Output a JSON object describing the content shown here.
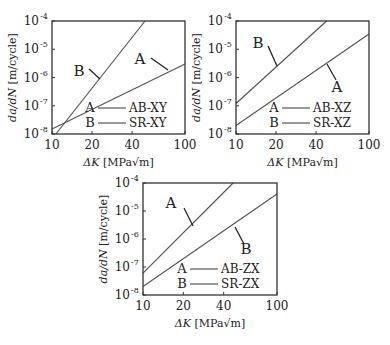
{
  "chart_data": [
    {
      "type": "line",
      "scale": {
        "x": "log",
        "y": "log"
      },
      "title": "",
      "xlabel": "ΔK [MPa√m]",
      "ylabel": "da/dN [m/cycle]",
      "xlim": [
        10,
        100
      ],
      "ylim": [
        1e-08,
        0.0001
      ],
      "xticks": [
        "10",
        "20",
        "40",
        "100"
      ],
      "yticks": [
        "10^-8",
        "10^-7",
        "10^-6",
        "10^-5",
        "10^-4"
      ],
      "legend": [
        {
          "letter": "A",
          "name": "AB-XY"
        },
        {
          "letter": "B",
          "name": "SR-XY"
        }
      ],
      "series": [
        {
          "name": "AB-XY",
          "label": "A",
          "points": [
            [
              10,
              1.5e-08
            ],
            [
              100,
              3e-06
            ]
          ]
        },
        {
          "name": "SR-XY",
          "label": "B",
          "points": [
            [
              10.7,
              1e-08
            ],
            [
              50,
              0.0001
            ]
          ]
        }
      ],
      "box": {
        "x": 52,
        "y": 21,
        "w": 133,
        "h": 113
      },
      "annotations": [
        {
          "text": "B",
          "x": 79,
          "y": 76,
          "lx1": 89,
          "ly1": 69,
          "lx2": 100,
          "ly2": 79
        },
        {
          "text": "A",
          "x": 140,
          "y": 64,
          "lx1": 151,
          "ly1": 58,
          "lx2": 168,
          "ly2": 70
        }
      ]
    },
    {
      "type": "line",
      "scale": {
        "x": "log",
        "y": "log"
      },
      "title": "",
      "xlabel": "ΔK [MPa√m]",
      "ylabel": "da/dN [m/cycle]",
      "xlim": [
        10,
        100
      ],
      "ylim": [
        1e-08,
        0.0001
      ],
      "xticks": [
        "10",
        "20",
        "40",
        "100"
      ],
      "yticks": [
        "10^-8",
        "10^-7",
        "10^-6",
        "10^-5",
        "10^-4"
      ],
      "legend": [
        {
          "letter": "A",
          "name": "AB-XZ"
        },
        {
          "letter": "B",
          "name": "SR-XZ"
        }
      ],
      "series": [
        {
          "name": "AB-XZ",
          "label": "A",
          "points": [
            [
              10,
              2e-08
            ],
            [
              100,
              3.5e-05
            ]
          ]
        },
        {
          "name": "SR-XZ",
          "label": "B",
          "points": [
            [
              10,
              1.2e-07
            ],
            [
              48,
              0.0001
            ]
          ]
        }
      ],
      "box": {
        "x": 236,
        "y": 21,
        "w": 133,
        "h": 113
      },
      "annotations": [
        {
          "text": "B",
          "x": 258,
          "y": 48,
          "lx1": 268,
          "ly1": 46,
          "lx2": 277,
          "ly2": 66
        },
        {
          "text": "A",
          "x": 337,
          "y": 92,
          "lx1": 327,
          "ly1": 64,
          "lx2": 336,
          "ly2": 80
        }
      ]
    },
    {
      "type": "line",
      "scale": {
        "x": "log",
        "y": "log"
      },
      "title": "",
      "xlabel": "ΔK [MPa√m]",
      "ylabel": "da/dN [m/cycle]",
      "xlim": [
        10,
        100
      ],
      "ylim": [
        1e-08,
        0.0001
      ],
      "xticks": [
        "10",
        "20",
        "40",
        "100"
      ],
      "yticks": [
        "10^-8",
        "10^-7",
        "10^-6",
        "10^-5",
        "10^-4"
      ],
      "legend": [
        {
          "letter": "A",
          "name": "AB-ZX"
        },
        {
          "letter": "B",
          "name": "SR-ZX"
        }
      ],
      "series": [
        {
          "name": "AB-ZX",
          "label": "A",
          "points": [
            [
              10,
              6e-08
            ],
            [
              47,
              0.0001
            ]
          ]
        },
        {
          "name": "SR-ZX",
          "label": "B",
          "points": [
            [
              10,
              2e-08
            ],
            [
              100,
              4e-05
            ]
          ]
        }
      ],
      "box": {
        "x": 143,
        "y": 183,
        "w": 134,
        "h": 112
      },
      "annotations": [
        {
          "text": "A",
          "x": 171,
          "y": 208,
          "lx1": 184,
          "ly1": 208,
          "lx2": 193,
          "ly2": 226
        },
        {
          "text": "B",
          "x": 246,
          "y": 254,
          "lx1": 235,
          "ly1": 227,
          "lx2": 244,
          "ly2": 244
        }
      ]
    }
  ],
  "style": {
    "line_color": "#555555",
    "axis_color": "#333333",
    "text_color": "#222222"
  }
}
